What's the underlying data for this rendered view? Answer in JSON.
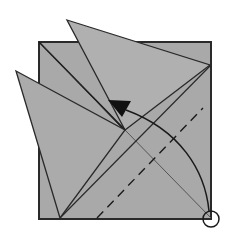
{
  "diagram": {
    "type": "origami-fold-step",
    "colors": {
      "paper": "#a9a9a9",
      "paper_light": "#b4b4b4",
      "line": "#2a2a2a",
      "arrow": "#111111",
      "background": "#ffffff"
    },
    "elements": [
      {
        "name": "base-square",
        "kind": "paper"
      },
      {
        "name": "top-flap",
        "kind": "paper-flap"
      },
      {
        "name": "left-flap",
        "kind": "paper-flap"
      },
      {
        "name": "valley-fold-line",
        "kind": "dashed-line"
      },
      {
        "name": "fold-arrow",
        "kind": "curved-arrow"
      },
      {
        "name": "reference-circle",
        "kind": "circle-marker"
      }
    ]
  }
}
